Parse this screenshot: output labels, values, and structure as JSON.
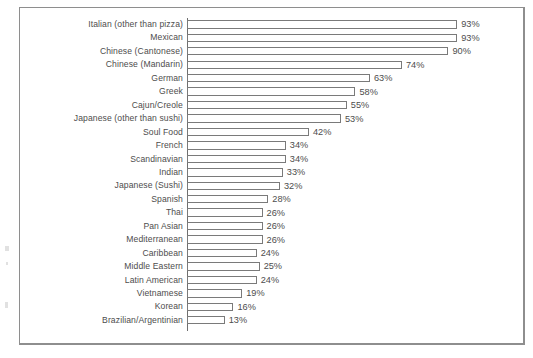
{
  "chart_data": {
    "type": "bar",
    "orientation": "horizontal",
    "title": "",
    "subtitle": "",
    "xlabel": "",
    "ylabel": "",
    "xlim": [
      0,
      100
    ],
    "grid": false,
    "legend": null,
    "value_suffix": "%",
    "categories": [
      "Italian (other than pizza)",
      "Mexican",
      "Chinese (Cantonese)",
      "Chinese (Mandarin)",
      "German",
      "Greek",
      "Cajun/Creole",
      "Japanese (other than sushi)",
      "Soul Food",
      "French",
      "Scandinavian",
      "Indian",
      "Japanese (Sushi)",
      "Spanish",
      "Thai",
      "Pan Asian",
      "Mediterranean",
      "Caribbean",
      "Middle Eastern",
      "Latin American",
      "Vietnamese",
      "Korean",
      "Brazilian/Argentinian"
    ],
    "values": [
      93,
      93,
      90,
      74,
      63,
      58,
      55,
      53,
      42,
      34,
      34,
      33,
      32,
      28,
      26,
      26,
      26,
      24,
      25,
      24,
      19,
      16,
      13
    ],
    "labels": [
      "93%",
      "93%",
      "90%",
      "74%",
      "63%",
      "58%",
      "55%",
      "53%",
      "42%",
      "34%",
      "34%",
      "33%",
      "32%",
      "28%",
      "26%",
      "26%",
      "26%",
      "24%",
      "25%",
      "24%",
      "19%",
      "16%",
      "13%"
    ],
    "colors": {
      "bar_fill": "#ffffff",
      "bar_outline": "#7a7a7a",
      "axis": "#6f6f6f",
      "frame": "#8e8e8e",
      "text": "#4d4d4d",
      "background": "#ffffff"
    }
  }
}
